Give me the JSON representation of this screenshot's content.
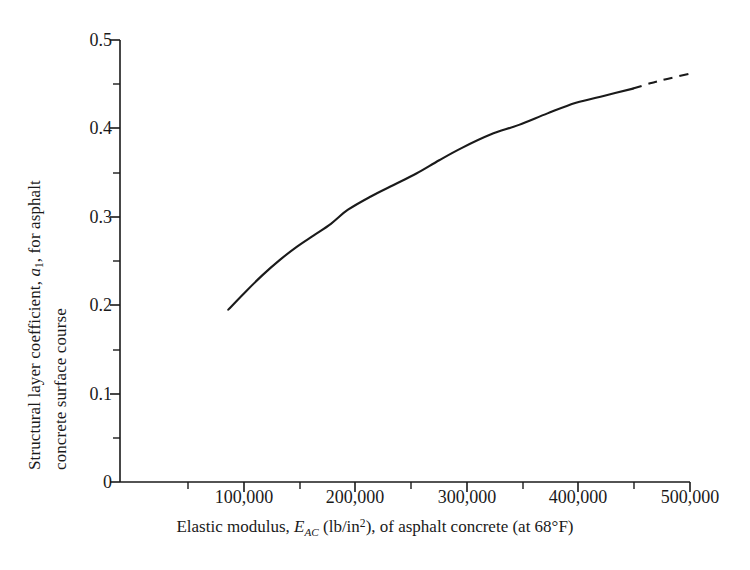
{
  "chart_data": {
    "type": "line",
    "title": "",
    "xlabel_parts": {
      "prefix": "Elastic modulus, ",
      "symbol_main": "E",
      "symbol_sub": "AC",
      "middle": " (lb/in",
      "exponent": "2",
      "suffix": "), of asphalt concrete (at 68°F)"
    },
    "xlabel": "Elastic modulus, E_AC (lb/in2), of asphalt concrete (at 68°F)",
    "ylabel_parts": {
      "line1_prefix": "Structural layer coefficient, ",
      "line1_symbol": "a",
      "line1_sub": "1",
      "line1_suffix": ", for asphalt",
      "line2": "concrete surface course"
    },
    "ylabel": "Structural layer coefficient, a1, for asphalt concrete surface course",
    "xlim": [
      0,
      500000
    ],
    "ylim": [
      0,
      0.5
    ],
    "xticks": [
      0,
      100000,
      200000,
      300000,
      400000,
      500000
    ],
    "xtick_labels": [
      "",
      "100,000",
      "200,000",
      "300,000",
      "400,000",
      "500,000"
    ],
    "xminor_ticks": [
      50000,
      150000,
      250000,
      350000,
      450000
    ],
    "yticks": [
      0,
      0.1,
      0.2,
      0.3,
      0.4,
      0.5
    ],
    "ytick_labels": [
      "0",
      "0.1",
      "0.2",
      "0.3",
      "0.4",
      "0.5"
    ],
    "yminor_ticks": [
      0.05,
      0.15,
      0.25,
      0.35,
      0.45
    ],
    "grid": false,
    "legend": null,
    "line_color": "#1a1a1a",
    "axis_color": "#1a1a1a",
    "series": [
      {
        "name": "structural layer coefficient curve (measured)",
        "style": "solid",
        "x": [
          95000,
          110000,
          125000,
          140000,
          155000,
          170000,
          185000,
          200000,
          220000,
          240000,
          260000,
          280000,
          300000,
          325000,
          350000,
          375000,
          400000,
          425000,
          450000
        ],
        "y": [
          0.195,
          0.215,
          0.234,
          0.251,
          0.266,
          0.279,
          0.292,
          0.308,
          0.323,
          0.336,
          0.349,
          0.364,
          0.378,
          0.393,
          0.404,
          0.417,
          0.429,
          0.437,
          0.445
        ]
      },
      {
        "name": "structural layer coefficient curve (extrapolated)",
        "style": "dashed",
        "x": [
          450000,
          465000,
          480000,
          500000
        ],
        "y": [
          0.445,
          0.451,
          0.456,
          0.462
        ]
      }
    ]
  }
}
